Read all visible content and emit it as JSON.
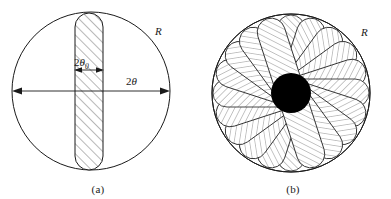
{
  "figure": {
    "background_color": "#ffffff",
    "stroke_color": "#1a1a1a",
    "fill_black": "#000000",
    "hatch_color": "#2b2b2b"
  },
  "panels": [
    {
      "id": "a",
      "caption": "(a)",
      "shape_name": "circle-with-vertical-stadium-slit",
      "labels": {
        "radius_label": "R",
        "slit_width_label_prefix": "2",
        "slit_width_label_symbol": "θ",
        "slit_width_label_subscript": "0",
        "diameter_label_prefix": "2",
        "diameter_label_symbol": "θ"
      },
      "geometry": {
        "circle_center_x": 91,
        "circle_center_y": 91,
        "circle_radius": 79,
        "slit_center_x": 89,
        "slit_half_width": 14,
        "slit_top_y": 13,
        "slit_bottom_y": 170
      }
    },
    {
      "id": "b",
      "caption": "(b)",
      "shape_name": "rotational-rosette-of-stadiums",
      "labels": {
        "radius_label": "R"
      },
      "geometry": {
        "circle_center_x": 96,
        "circle_center_y": 93,
        "circle_radius": 79,
        "petal_count": 10,
        "core_disc_radius": 20,
        "stadium_half_width": 14,
        "stadium_half_length": 79
      }
    }
  ],
  "captions": {
    "panel_a": "(a)",
    "panel_b": "(b)"
  }
}
